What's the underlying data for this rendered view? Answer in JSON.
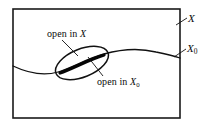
{
  "figure": {
    "width": 215,
    "height": 128,
    "background": "#ffffff",
    "ink_color": "#111111"
  },
  "labels": {
    "open_in_x": {
      "text_prefix": "open in ",
      "variable": "X",
      "subscript": "",
      "full_text": "open in X"
    },
    "open_in_x0": {
      "text_prefix": "open in ",
      "variable": "X",
      "subscript": "0",
      "full_text": "open in X0"
    },
    "space_x": {
      "variable": "X",
      "subscript": "",
      "full_text": "X"
    },
    "subspace_x0": {
      "variable": "X",
      "subscript": "0",
      "full_text": "X0"
    }
  },
  "shapes": {
    "ambient_rectangle": {
      "name": "X",
      "x": 13,
      "y": 9,
      "width": 167,
      "height": 109,
      "stroke": "#1a1a1a",
      "stroke_width": 1.6,
      "fill": "none"
    },
    "subspace_curve": {
      "name": "X0",
      "stroke": "#111111",
      "stroke_width": 1.3,
      "path": "M 13,66 C 30,74 44,76 58,72 C 72,68 88,58 104,54 C 122,49 140,48 156,52 C 166,54 174,56 180,58"
    },
    "open_set_ellipse": {
      "name": "open set in X",
      "cx": 82,
      "cy": 63,
      "rx": 28,
      "ry": 14,
      "rotation_deg": -22,
      "stroke": "#111111",
      "stroke_width": 1.5,
      "fill": "none"
    },
    "intersection_chord": {
      "name": "open set in X0",
      "stroke": "#050505",
      "stroke_width": 3.2,
      "path": "M 60,73 C 72,69 88,60 104,55"
    },
    "leader_open_in_x": {
      "path": "M 62,40 L 78,56",
      "stroke": "#111111",
      "stroke_width": 0.9
    },
    "leader_open_in_x0": {
      "path": "M 102,76 L 88,58",
      "stroke": "#111111",
      "stroke_width": 0.9
    },
    "leader_space_x": {
      "path": "M 186,17 L 176,24",
      "stroke": "#111111",
      "stroke_width": 0.9
    },
    "leader_subspace_x0": {
      "path": "M 185,48 L 175,56",
      "stroke": "#111111",
      "stroke_width": 0.9
    }
  }
}
